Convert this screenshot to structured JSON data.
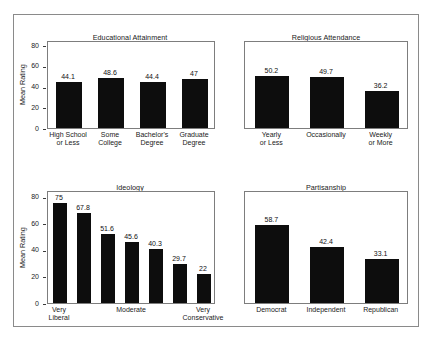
{
  "figure": {
    "background_color": "#ffffff",
    "bar_color": "#0d0d0d",
    "frame_color": "#8a8a8a",
    "axis_color": "#7d7d7d"
  },
  "chart_data": [
    {
      "type": "bar",
      "title": "Educational Attainment",
      "xlabel": "",
      "ylabel": "Mean Rating",
      "ylim": [
        0,
        85
      ],
      "yticks": [
        0,
        20,
        40,
        60,
        80
      ],
      "grid": false,
      "legend": "none",
      "show_yaxis": true,
      "categories": [
        "High School or Less",
        "Some College",
        "Bachelor's Degree",
        "Graduate Degree"
      ],
      "category_lines": [
        [
          "High School",
          "or Less"
        ],
        [
          "Some",
          "College"
        ],
        [
          "Bachelor's",
          "Degree"
        ],
        [
          "Graduate",
          "Degree"
        ]
      ],
      "values": [
        44.1,
        48.6,
        44.4,
        47
      ],
      "value_labels": [
        "44.1",
        "48.6",
        "44.4",
        "47"
      ]
    },
    {
      "type": "bar",
      "title": "Religious Attendance",
      "xlabel": "",
      "ylabel": "",
      "ylim": [
        0,
        85
      ],
      "yticks": [],
      "grid": false,
      "legend": "none",
      "show_yaxis": false,
      "categories": [
        "Yearly or Less",
        "Occasionally",
        "Weekly or More"
      ],
      "category_lines": [
        [
          "Yearly",
          "or Less"
        ],
        [
          "Occasionally",
          ""
        ],
        [
          "Weekly",
          "or More"
        ]
      ],
      "values": [
        50.2,
        49.7,
        36.2
      ],
      "value_labels": [
        "50.2",
        "49.7",
        "36.2"
      ]
    },
    {
      "type": "bar",
      "title": "Ideology",
      "xlabel": "",
      "ylabel": "Mean Rating",
      "ylim": [
        0,
        85
      ],
      "yticks": [
        0,
        20,
        40,
        60,
        80
      ],
      "grid": false,
      "legend": "none",
      "show_yaxis": true,
      "categories": [
        "Very Liberal",
        "",
        "",
        "Moderate",
        "",
        "",
        "Very Conservative"
      ],
      "category_lines": [
        [
          "Very",
          "Liberal"
        ],
        [
          "",
          ""
        ],
        [
          "",
          ""
        ],
        [
          "Moderate",
          ""
        ],
        [
          "",
          ""
        ],
        [
          "",
          ""
        ],
        [
          "Very",
          "Conservative"
        ]
      ],
      "values": [
        75,
        67.8,
        51.6,
        45.6,
        40.3,
        29.7,
        22
      ],
      "value_labels": [
        "75",
        "67.8",
        "51.6",
        "45.6",
        "40.3",
        "29.7",
        "22"
      ]
    },
    {
      "type": "bar",
      "title": "Partisanship",
      "xlabel": "",
      "ylabel": "",
      "ylim": [
        0,
        85
      ],
      "yticks": [],
      "grid": false,
      "legend": "none",
      "show_yaxis": false,
      "categories": [
        "Democrat",
        "Independent",
        "Republican"
      ],
      "category_lines": [
        [
          "Democrat",
          ""
        ],
        [
          "Independent",
          ""
        ],
        [
          "Republican",
          ""
        ]
      ],
      "values": [
        58.7,
        42.4,
        33.1
      ],
      "value_labels": [
        "58.7",
        "42.4",
        "33.1"
      ]
    }
  ],
  "layout": {
    "panels": [
      {
        "left": 47,
        "top": 33,
        "plot_left": 47,
        "plot_top": 41,
        "plot_width": 168,
        "plot_height": 88,
        "title_left": 30,
        "title_width": 200
      },
      {
        "left": 244,
        "top": 33,
        "plot_left": 244,
        "plot_top": 41,
        "plot_width": 164,
        "plot_height": 88,
        "title_left": 232,
        "title_width": 188
      },
      {
        "left": 47,
        "top": 183,
        "plot_left": 47,
        "plot_top": 191,
        "plot_width": 168,
        "plot_height": 113,
        "title_left": 30,
        "title_width": 200
      },
      {
        "left": 244,
        "top": 183,
        "plot_left": 244,
        "plot_top": 191,
        "plot_width": 164,
        "plot_height": 113,
        "title_left": 232,
        "title_width": 188
      }
    ]
  }
}
